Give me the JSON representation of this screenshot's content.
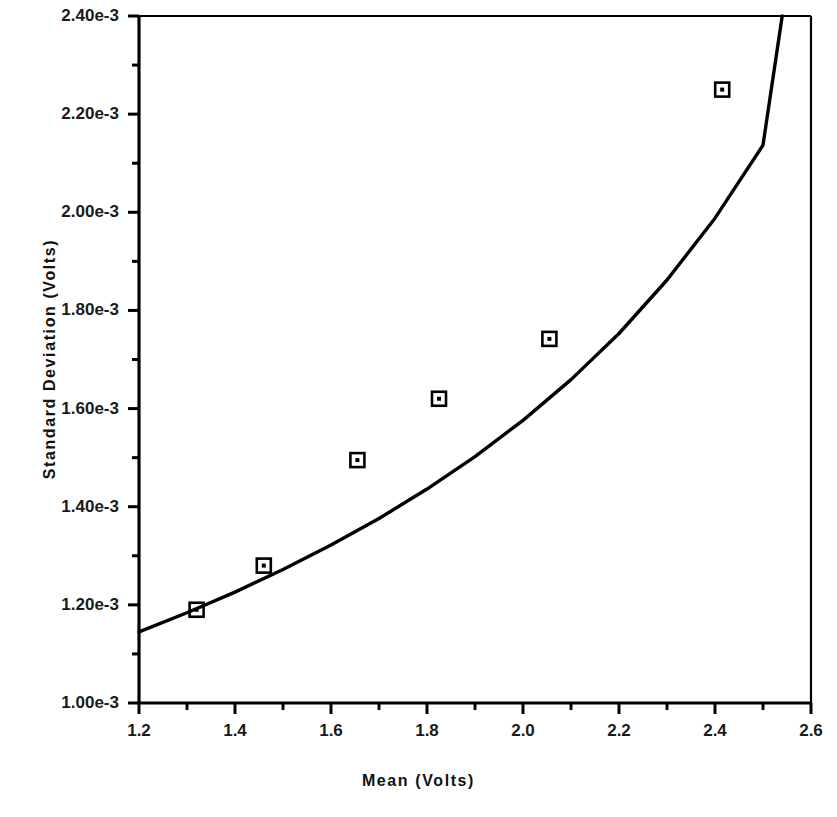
{
  "chart_data": {
    "type": "scatter",
    "title": "",
    "xlabel": "Mean  (Volts)",
    "ylabel": "Standard  Deviation  (Volts)",
    "xlim": [
      1.2,
      2.6
    ],
    "ylim": [
      0.001,
      0.0024
    ],
    "grid": false,
    "legend": null,
    "x_major_ticks": [
      1.2,
      1.4,
      1.6,
      1.8,
      2.0,
      2.2,
      2.4,
      2.6
    ],
    "x_tick_labels": [
      "1.2",
      "1.4",
      "1.6",
      "1.8",
      "2.0",
      "2.2",
      "2.4",
      "2.6"
    ],
    "x_minor_ticks": [
      1.3,
      1.5,
      1.7,
      1.9,
      2.1,
      2.3,
      2.5
    ],
    "y_major_ticks": [
      0.0024,
      0.0022,
      0.002,
      0.0018,
      0.0016,
      0.0014,
      0.0012,
      0.001
    ],
    "y_tick_labels": [
      "2.40e-3",
      "2.20e-3",
      "2.00e-3",
      "1.80e-3",
      "1.60e-3",
      "1.40e-3",
      "1.20e-3",
      "1.00e-3"
    ],
    "y_minor_ticks": [
      0.0023,
      0.0021,
      0.0019,
      0.0017,
      0.0015,
      0.0013,
      0.0011
    ],
    "series": [
      {
        "name": "measurements",
        "type": "scatter",
        "marker": "square-with-center-dot",
        "color": "#000000",
        "points": [
          {
            "x": 1.32,
            "y": 0.00119
          },
          {
            "x": 1.46,
            "y": 0.00128
          },
          {
            "x": 1.655,
            "y": 0.001495
          },
          {
            "x": 1.825,
            "y": 0.00162
          },
          {
            "x": 2.055,
            "y": 0.001742
          },
          {
            "x": 2.415,
            "y": 0.00225
          }
        ]
      },
      {
        "name": "fit-curve",
        "type": "line",
        "color": "#000000",
        "points": [
          {
            "x": 1.2,
            "y": 0.001145
          },
          {
            "x": 1.3,
            "y": 0.001184
          },
          {
            "x": 1.4,
            "y": 0.001226
          },
          {
            "x": 1.5,
            "y": 0.001272
          },
          {
            "x": 1.6,
            "y": 0.001322
          },
          {
            "x": 1.7,
            "y": 0.001376
          },
          {
            "x": 1.8,
            "y": 0.001436
          },
          {
            "x": 1.9,
            "y": 0.001502
          },
          {
            "x": 2.0,
            "y": 0.001576
          },
          {
            "x": 2.1,
            "y": 0.001659
          },
          {
            "x": 2.2,
            "y": 0.001753
          },
          {
            "x": 2.3,
            "y": 0.001862
          },
          {
            "x": 2.4,
            "y": 0.001988
          },
          {
            "x": 2.5,
            "y": 0.002137
          },
          {
            "x": 2.54,
            "y": 0.0024
          }
        ]
      }
    ]
  }
}
